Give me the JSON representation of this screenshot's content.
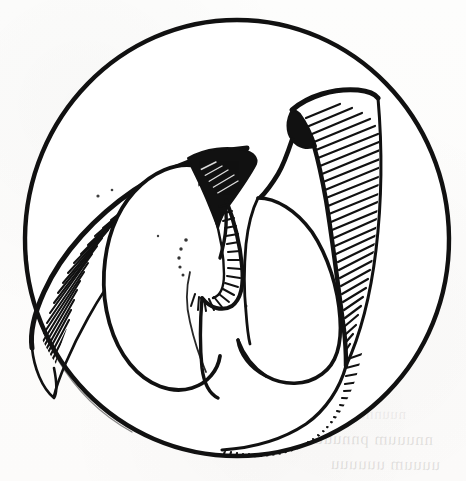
{
  "figure": {
    "medium": "scanned pen-and-ink line drawing",
    "subject_label": "circular-field line illustration",
    "background_color": "#fdfdfc",
    "ink_color": "#111111",
    "ghost_ink_color": "#5a5652",
    "canvas": {
      "width": 466,
      "height": 481
    }
  },
  "field": {
    "name": "circular outline",
    "center_x": 237,
    "center_y": 238,
    "radius_x": 212,
    "radius_y": 218,
    "stroke_width": 4.2
  },
  "structures": {
    "left_wing": {
      "name": "left pointed wing with parallel hatching",
      "hatch_count": 34,
      "fill": "solid-black-edge"
    },
    "left_inner_lobe": {
      "name": "left inner lobe, U-shaped base",
      "fill": "white"
    },
    "central_peak": {
      "name": "upper-central solid black wedge",
      "fill": "#111111"
    },
    "central_channel": {
      "name": "central narrow channel with radiating hatching",
      "hatch_count": 18
    },
    "right_hook": {
      "name": "upper-right hooked projection",
      "fill": "#111111",
      "hatch_count": 30
    },
    "right_lobe": {
      "name": "right inner lobe",
      "fill": "white"
    },
    "right_margin_hatching": {
      "name": "right marginal hatched band following the circle",
      "hatch_count": 52
    },
    "stipple_marks": {
      "name": "faint dotted guide marks near the centre",
      "count": 11
    }
  },
  "ghost_text": {
    "note": "faint show-through text from the reverse side of the page, illegible",
    "line_1": "nnuuum pnnuuu",
    "line_2": "uuuum uuuuuu",
    "line_3": "nuunnuu"
  }
}
